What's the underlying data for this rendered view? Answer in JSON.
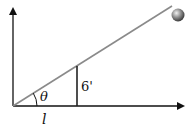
{
  "diagram": {
    "type": "inclined-plane",
    "labels": {
      "angle": "θ",
      "post_height": "6'",
      "base_length": "l"
    },
    "colors": {
      "axes": "#111111",
      "incline": "#8a8a8a",
      "post": "#222222",
      "ball_light": "#f0f0f0",
      "ball_dark": "#3a3a3a"
    }
  }
}
